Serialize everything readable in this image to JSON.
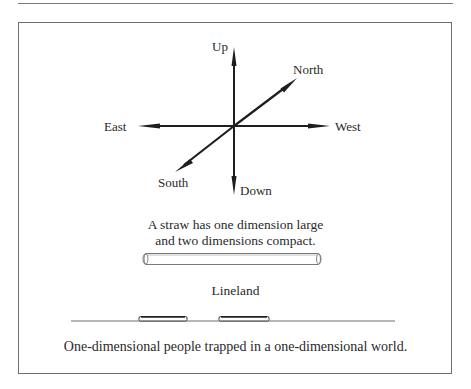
{
  "figure": {
    "axes": {
      "up": "Up",
      "down": "Down",
      "east": "East",
      "west": "West",
      "north": "North",
      "south": "South"
    },
    "straw_caption_line1": "A straw has one dimension large",
    "straw_caption_line2": "and two dimensions compact.",
    "lineland_label": "Lineland",
    "bottom_caption": "One-dimensional people trapped in a one-dimensional world.",
    "colors": {
      "ink": "#1e1e1e",
      "frame": "#6e6e6e",
      "straw": "#7a7a7a"
    }
  }
}
